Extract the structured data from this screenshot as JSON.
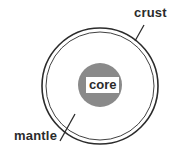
{
  "diagram": {
    "labels": {
      "crust": "crust",
      "mantle": "mantle",
      "core": "core"
    },
    "colors": {
      "core_fill": "#8a8a8a",
      "outline": "#2b2b2b",
      "background": "#ffffff"
    }
  }
}
